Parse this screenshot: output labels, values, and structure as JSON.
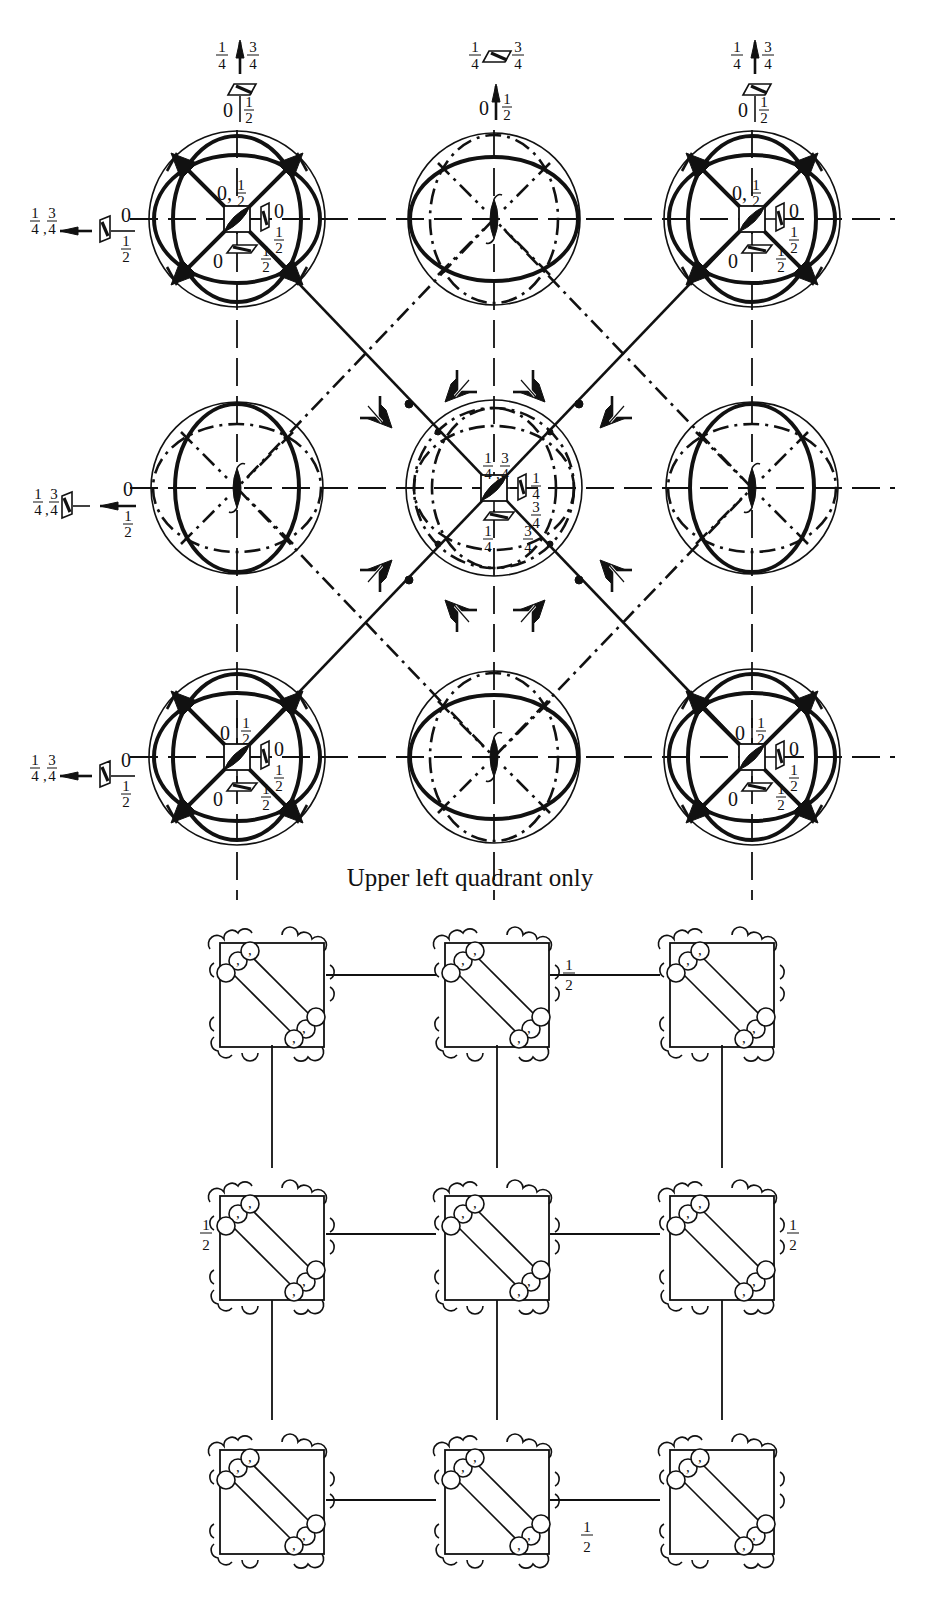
{
  "figure": {
    "upper_panel": {
      "caption": "Upper left quadrant only",
      "top_labels": [
        {
          "position": "left",
          "upper": [
            "1/4",
            "3/4"
          ],
          "lower": [
            "0",
            "1/2"
          ]
        },
        {
          "position": "center",
          "upper": [
            "1/4",
            "3/4"
          ],
          "lower": [
            "0",
            "1/2"
          ]
        },
        {
          "position": "right",
          "upper": [
            "1/4",
            "3/4"
          ],
          "lower": [
            "0",
            "1/2"
          ]
        }
      ],
      "left_labels": [
        {
          "row": "top",
          "left": "1/4, 3/4",
          "right": [
            "0",
            "1/2"
          ]
        },
        {
          "row": "middle",
          "left": "1/4, 3/4",
          "right": [
            "0",
            "1/2"
          ]
        },
        {
          "row": "bottom",
          "left": "1/4, 3/4",
          "right": [
            "0",
            "1/2"
          ]
        }
      ],
      "corner_sphere_labels": {
        "top": "0, 1/2",
        "side": [
          "0",
          "1/2"
        ],
        "bottom": [
          "0",
          "1/2"
        ]
      },
      "bottom_corner_sphere_labels": {
        "top": "0 | 1/2",
        "side": [
          "0",
          "1/2"
        ],
        "bottom": [
          "0",
          "1/2"
        ]
      },
      "center_sphere_labels": {
        "top": "1/4, 3/4",
        "side": [
          "1/4",
          "3/4"
        ],
        "bottom": [
          "1/4",
          "3/4"
        ]
      }
    },
    "lower_panel": {
      "half_labels": [
        "1/2",
        "1/2",
        "1/2",
        "1/2"
      ]
    }
  }
}
